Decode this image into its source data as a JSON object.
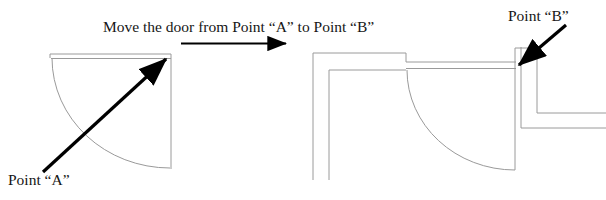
{
  "figure": {
    "title": "Move the door from Point “A” to Point “B”",
    "kind": "architectural-door-relocation-diagram",
    "background_color": "#ffffff",
    "line_color": "#8c8c8c",
    "arrow_color": "#000000",
    "text_color": "#161616"
  },
  "labels": {
    "point_a": "Point “A”",
    "point_b": "Point “B”"
  },
  "left_panel": {
    "name": "before-door-at-point-a",
    "description": "Door leaf at top wall with quarter-circle swing arc opening down-left",
    "door_opening_width": 118,
    "swing_direction": "counter-clockwise",
    "hinge_corner": "top-right"
  },
  "right_panel": {
    "name": "after-door-at-point-b",
    "description": "Floor plan corner with walls; door leaf relocated to right side with quarter-circle swing arc",
    "door_opening_width": 110,
    "swing_direction": "clockwise",
    "hinge_corner": "top-right"
  },
  "annotations": {
    "transition_arrow": "horizontal-arrow-left-to-right",
    "point_a_arrow": "diagonal-arrow-pointing-up-right",
    "point_b_arrow": "diagonal-arrow-pointing-down-left"
  }
}
